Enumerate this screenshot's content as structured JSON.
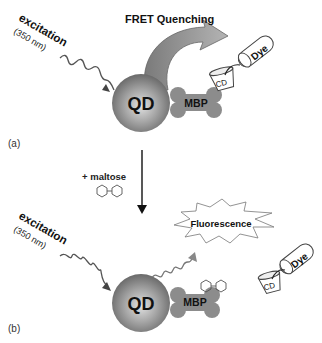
{
  "panel_a": {
    "label": "(a)",
    "excitation_label": "excitation",
    "wavelength_label": "(350 nm)",
    "title": "FRET Quenching",
    "qd_label": "QD",
    "mbp_label": "MBP",
    "cd_label": "CD",
    "dye_label": "Dye"
  },
  "transition": {
    "label": "+ maltose"
  },
  "panel_b": {
    "label": "(b)",
    "excitation_label": "excitation",
    "wavelength_label": "(350 nm)",
    "emission_label": "Fluorescence",
    "qd_label": "QD",
    "mbp_label": "MBP",
    "cd_label": "CD",
    "dye_label": "Dye"
  },
  "colors": {
    "qd_dark": "#6e6e6e",
    "qd_light": "#d8d8d8",
    "mbp": "#8c8c8c",
    "arrow_fill": "#9a9a9a",
    "line": "#333333",
    "text": "#111111"
  }
}
